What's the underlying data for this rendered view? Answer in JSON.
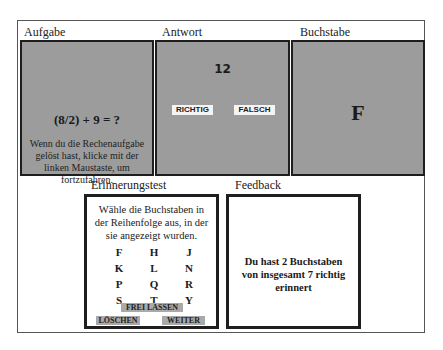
{
  "headers": {
    "task": "Aufgabe",
    "answer": "Antwort",
    "letter": "Buchstabe",
    "memory_test": "Erinnerungstest",
    "feedback": "Feedback"
  },
  "task_panel": {
    "equation": "(8/2) + 9 = ?",
    "instruction": "Wenn du die Rechenaufgabe gelöst hast, klicke mit der linken Maustaste, um fortzufahren."
  },
  "answer_panel": {
    "proposed_answer": "12",
    "correct_label": "RICHTIG",
    "wrong_label": "FALSCH"
  },
  "letter_panel": {
    "letter": "F"
  },
  "memory_panel": {
    "instruction": "Wähle die Buchstaben in der Reihenfolge aus, in der sie angezeigt wurden.",
    "letters": [
      [
        "F",
        "H",
        "J"
      ],
      [
        "K",
        "L",
        "N"
      ],
      [
        "P",
        "Q",
        "R"
      ],
      [
        "S",
        "T",
        "Y"
      ]
    ],
    "blank_label": "FREI LASSEN",
    "clear_label": "LÖSCHEN",
    "next_label": "WEITER"
  },
  "feedback_panel": {
    "message": "Du hast 2 Buchstaben von insgesamt 7 richtig erinnert"
  },
  "colors": {
    "panel_gray": "#9c9c9c",
    "border_dark": "#1e1e1e",
    "button_gray": "#a9a9a9"
  }
}
